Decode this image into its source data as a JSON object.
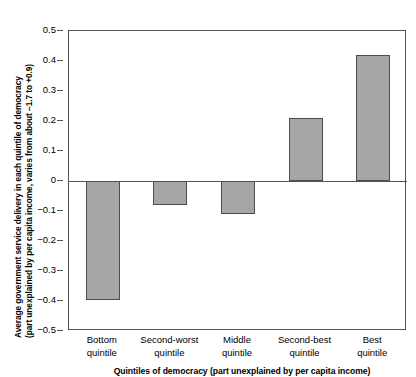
{
  "chart_data": {
    "type": "bar",
    "title": "",
    "subtitle": "",
    "categories": [
      "Bottom\nquintile",
      "Second-worst\nquintile",
      "Middle\nquintile",
      "Second-best\nquintile",
      "Best\nquintile"
    ],
    "category_lines": [
      [
        "Bottom",
        "quintile"
      ],
      [
        "Second-worst",
        "quintile"
      ],
      [
        "Middle",
        "quintile"
      ],
      [
        "Second-best",
        "quintile"
      ],
      [
        "Best",
        "quintile"
      ]
    ],
    "values": [
      -0.395,
      -0.08,
      -0.11,
      0.21,
      0.42
    ],
    "xlabel": "Quintiles of democracy (part unexplained by per capita income)",
    "ylabel": "Average government service delivery in each quintile of democracy (part unexplained by per capita income, varies from about −1.7 to +0.9)",
    "ylabel_lines": [
      "Average government service delivery in each quintile of democracy",
      "(part unexplained by per capita income, varies from about −1.7 to +0.9)"
    ],
    "ylim": [
      -0.5,
      0.5
    ],
    "yticks": [
      0.5,
      0.4,
      0.3,
      0.2,
      0.1,
      0,
      -0.1,
      -0.2,
      -0.3,
      -0.4,
      -0.5
    ],
    "ytick_labels": [
      "0.5",
      "0.4",
      "0.3",
      "0.2",
      "0.1",
      "0",
      "−0.1",
      "−0.2",
      "−0.3",
      "−0.4",
      "−0.5"
    ],
    "grid": false,
    "legend": null,
    "bar_color": "#a6a6a6",
    "bar_border_color": "#4d4d4d",
    "axis_color": "#555555",
    "zero_line": 0
  }
}
